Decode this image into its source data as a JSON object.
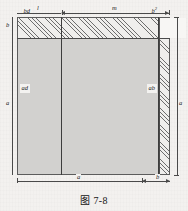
{
  "figure": {
    "caption": "图 7-8",
    "regions": [
      {
        "id": "bd",
        "label": "bd",
        "fill": "hatched",
        "position": "top-left-strip"
      },
      {
        "id": "b2",
        "label": "b",
        "sup": "2",
        "fill": "white",
        "position": "top-right-square"
      },
      {
        "id": "ad",
        "label": "ad",
        "fill": "shaded",
        "position": "left-body"
      },
      {
        "id": "ab",
        "label": "ab",
        "fill": "hatched",
        "position": "right-column"
      }
    ],
    "dimensions": {
      "top_left": "l",
      "top_right": "m",
      "bottom_left": "a",
      "bottom_right": "b",
      "left_upper": "b",
      "left_lower": "a",
      "right_full": "a"
    },
    "colors": {
      "paper": "#f2f0ee",
      "line": "#4a4a4a",
      "hatch": "#6d6d6d",
      "shade": "#d2d1cf",
      "white_box": "#f7f6f4"
    }
  }
}
